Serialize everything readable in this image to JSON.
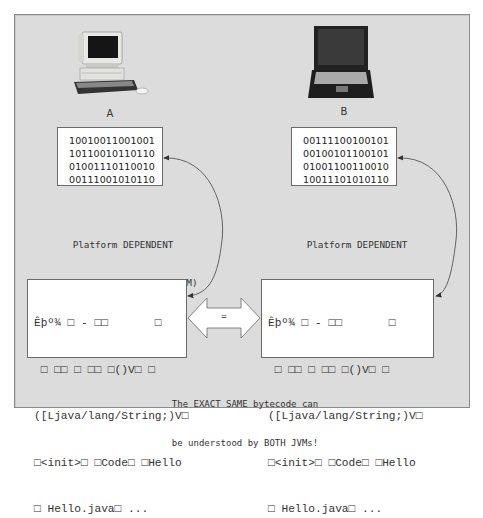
{
  "diagram": {
    "machines": [
      {
        "id": "A",
        "label": "A",
        "icon": "desktop-computer-icon"
      },
      {
        "id": "B",
        "label": "B",
        "icon": "laptop-computer-icon"
      }
    ],
    "native_code": {
      "A": [
        "10010011001001",
        "10110010110110",
        "01001110110010",
        "00111001010110"
      ],
      "B": [
        "00111100100101",
        "00100101100101",
        "01001100110010",
        "10011101010110"
      ]
    },
    "jvm_labels": {
      "A": {
        "line1": "Platform DEPENDENT",
        "line2": "Java Virtual Machine (JVM)",
        "line3": "for platform \"A\""
      },
      "B": {
        "line1": "Platform DEPENDENT",
        "line2": "Java Virtual Machine (JVM)",
        "line3": "for platform \"B\""
      }
    },
    "bytecode": {
      "lines": [
        "Êþº¾ □ - □□       □",
        " □ □□ □ □□ □()V□ □",
        "([Ljava/lang/String;)V□",
        "□<init>□ □Code□ □Hello",
        "□ Hello.java□ ..."
      ]
    },
    "equals_arrow": {
      "label": "="
    },
    "caption": {
      "line1": "The EXACT SAME bytecode can",
      "line2": "be understood by BOTH JVMs!"
    },
    "colors": {
      "panel_bg": "#dcdcdc",
      "panel_border": "#8a8a8a",
      "box_bg": "#ffffff",
      "arrow_stroke": "#555555"
    }
  }
}
